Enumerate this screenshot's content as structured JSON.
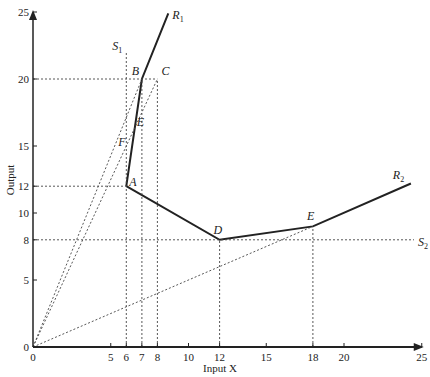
{
  "chart_data": {
    "type": "line",
    "title": "",
    "xlabel": "Input X",
    "ylabel": "Output",
    "xlim": [
      0,
      25
    ],
    "ylim": [
      0,
      25
    ],
    "x_ticks": [
      0,
      5,
      6,
      7,
      8,
      10,
      12,
      15,
      18,
      20,
      25
    ],
    "y_ticks": [
      0,
      5,
      8,
      10,
      12,
      15,
      20,
      25
    ],
    "grid": false,
    "series": [
      {
        "name": "R1",
        "style": "solid",
        "points": [
          [
            6,
            12
          ],
          [
            7,
            20
          ],
          [
            8.7,
            24.9
          ]
        ]
      },
      {
        "name": "R2",
        "style": "solid",
        "points": [
          [
            6,
            12
          ],
          [
            12,
            8
          ],
          [
            18,
            9
          ],
          [
            24.3,
            12.2
          ]
        ]
      },
      {
        "name": "S1",
        "style": "dotted",
        "points": [
          [
            6,
            0
          ],
          [
            6,
            22
          ]
        ]
      },
      {
        "name": "S2",
        "style": "dotted",
        "points": [
          [
            0,
            8
          ],
          [
            24.5,
            8
          ]
        ]
      },
      {
        "name": "ray-OB",
        "style": "dotted",
        "points": [
          [
            0,
            0
          ],
          [
            7,
            20
          ]
        ]
      },
      {
        "name": "ray-OC",
        "style": "dotted",
        "points": [
          [
            0,
            0
          ],
          [
            8,
            20
          ]
        ]
      },
      {
        "name": "ray-OE",
        "style": "dotted",
        "points": [
          [
            0,
            0
          ],
          [
            18,
            9
          ]
        ]
      },
      {
        "name": "guide-20",
        "style": "dotted",
        "points": [
          [
            0,
            20
          ],
          [
            8,
            20
          ]
        ]
      },
      {
        "name": "guide-12",
        "style": "dotted",
        "points": [
          [
            0,
            12
          ],
          [
            6,
            12
          ]
        ]
      },
      {
        "name": "drop-7",
        "style": "dotted",
        "points": [
          [
            7,
            0
          ],
          [
            7,
            20
          ]
        ]
      },
      {
        "name": "drop-8",
        "style": "dotted",
        "points": [
          [
            8,
            0
          ],
          [
            8,
            20
          ]
        ]
      },
      {
        "name": "drop-12",
        "style": "dotted",
        "points": [
          [
            12,
            0
          ],
          [
            12,
            8
          ]
        ]
      },
      {
        "name": "drop-18",
        "style": "dotted",
        "points": [
          [
            18,
            0
          ],
          [
            18,
            9
          ]
        ]
      }
    ],
    "annotations": [
      {
        "text": "A",
        "x": 6,
        "y": 12
      },
      {
        "text": "B",
        "x": 7,
        "y": 20
      },
      {
        "text": "C",
        "x": 8,
        "y": 20
      },
      {
        "text": "D",
        "x": 12,
        "y": 8
      },
      {
        "text": "E",
        "x": 18,
        "y": 9
      },
      {
        "text": "E",
        "x": 6.8,
        "y": 16.5
      },
      {
        "text": "F",
        "x": 6,
        "y": 15
      },
      {
        "text": "R1",
        "x": 8.7,
        "y": 24.9
      },
      {
        "text": "R2",
        "x": 24.3,
        "y": 12.2
      },
      {
        "text": "S1",
        "x": 6,
        "y": 22
      },
      {
        "text": "S2",
        "x": 24.5,
        "y": 8
      }
    ]
  },
  "labels": {
    "xlabel": "Input X",
    "ylabel": "Output"
  }
}
